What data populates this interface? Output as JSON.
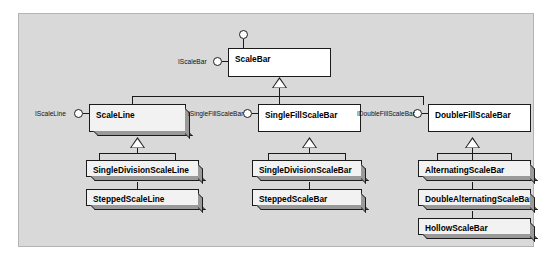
{
  "diagram": {
    "panel_color": "#d9d9d9",
    "box_color": "#ffffff",
    "shadow_color": "#9a9a9a",
    "line_color": "#1b1b1b"
  },
  "classes": {
    "root": "ScaleBar",
    "scale_line": "ScaleLine",
    "single_fill": "SingleFillScaleBar",
    "double_fill": "DoubleFillScaleBar",
    "single_division_scale_line": "SingleDivisionScaleLine",
    "stepped_scale_line": "SteppedScaleLine",
    "single_division_scale_bar": "SingleDivisionScaleBar",
    "stepped_scale_bar": "SteppedScaleBar",
    "alternating_scale_bar": "AlternatingScaleBar",
    "double_alternating_scale_bar": "DoubleAlternatingScaleBar",
    "hollow_scale_bar": "HollowScaleBar"
  },
  "interfaces": {
    "scale_bar": "IScaleBar",
    "scale_line": "IScaleLine",
    "single_fill": "ISingleFillScaleBar",
    "double_fill": "IDoubleFillScaleBar",
    "top_unlabeled": ""
  }
}
